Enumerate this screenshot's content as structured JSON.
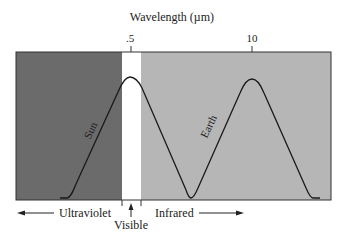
{
  "figure": {
    "axis_title": "Wavelength (µm)",
    "ticks": [
      {
        "label": ".5",
        "x": 131
      },
      {
        "label": "10",
        "x": 252
      }
    ],
    "regions": [
      {
        "name": "ultraviolet",
        "color": "#6b6b6b"
      },
      {
        "name": "visible",
        "color": "#ffffff"
      },
      {
        "name": "infrared",
        "color": "#b6b6b6"
      }
    ],
    "curves": [
      {
        "label": "Sun"
      },
      {
        "label": "Earth"
      }
    ],
    "bottom_labels": {
      "ultraviolet": "Ultraviolet",
      "visible": "Visible",
      "infrared": "Infrared"
    }
  }
}
